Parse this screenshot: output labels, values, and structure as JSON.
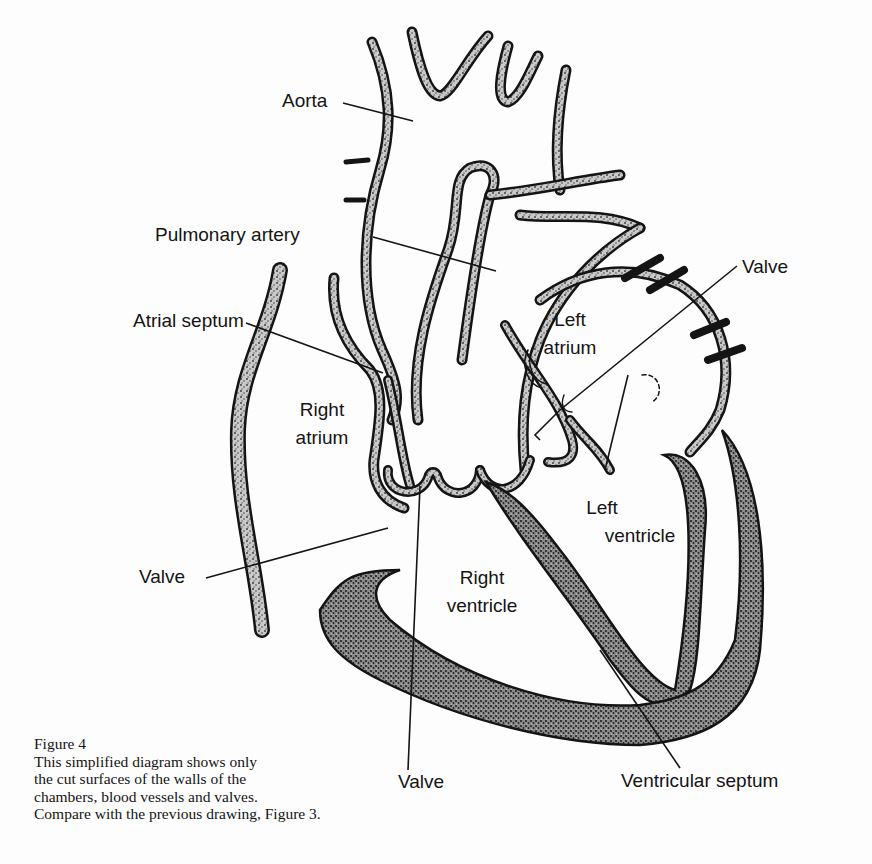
{
  "figure": {
    "number_label": "Figure 4",
    "caption_lines": [
      "This simplified diagram shows only",
      "the cut surfaces of the walls of the",
      "chambers, blood vessels and valves.",
      "Compare with the previous drawing, Figure 3."
    ]
  },
  "labels": {
    "aorta": "Aorta",
    "pulmonary_artery": "Pulmonary artery",
    "atrial_septum": "Atrial septum",
    "right_atrium_1": "Right",
    "right_atrium_2": "atrium",
    "left_atrium_1": "Left",
    "left_atrium_2": "atrium",
    "left_ventricle_1": "Left",
    "left_ventricle_2": "ventricle",
    "right_ventricle_1": "Right",
    "right_ventricle_2": "ventricle",
    "valve_top_right": "Valve",
    "valve_left": "Valve",
    "valve_bottom": "Valve",
    "ventricular_septum": "Ventricular septum"
  },
  "colors": {
    "ink": "#141414",
    "wall_fill": "#9a9a9a",
    "paper": "#fdfdfd"
  }
}
